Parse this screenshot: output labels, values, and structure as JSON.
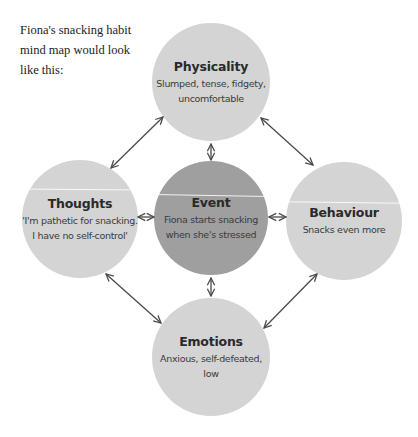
{
  "intro_text": "Fiona's snacking habit mind map would look like this:",
  "colors": {
    "outer_node": "#d4d4d4",
    "center_node": "#9f9f9f",
    "arrow": "#4a4a4a",
    "background": "#ffffff"
  },
  "nodes": {
    "physicality": {
      "title": "Physicality",
      "desc_line1": "Slumped, tense, fidgety,",
      "desc_line2": "uncomfortable"
    },
    "thoughts": {
      "title": "Thoughts",
      "desc_line1": "'I'm pathetic for snacking.",
      "desc_line2": "I have no self-control'"
    },
    "event": {
      "title": "Event",
      "desc_line1": "Fiona starts snacking",
      "desc_line2": "when she's stressed"
    },
    "behaviour": {
      "title": "Behaviour",
      "desc_line1": "Snacks even more"
    },
    "emotions": {
      "title": "Emotions",
      "desc_line1": "Anxious, self-defeated,",
      "desc_line2": "low"
    }
  },
  "connections": [
    {
      "from": "physicality",
      "to": "event",
      "type": "double-arrow"
    },
    {
      "from": "thoughts",
      "to": "event",
      "type": "double-arrow"
    },
    {
      "from": "event",
      "to": "behaviour",
      "type": "double-arrow"
    },
    {
      "from": "event",
      "to": "emotions",
      "type": "double-arrow"
    },
    {
      "from": "thoughts",
      "to": "physicality",
      "type": "double-arrow"
    },
    {
      "from": "physicality",
      "to": "behaviour",
      "type": "double-arrow"
    },
    {
      "from": "thoughts",
      "to": "emotions",
      "type": "double-arrow"
    },
    {
      "from": "emotions",
      "to": "behaviour",
      "type": "double-arrow"
    }
  ]
}
